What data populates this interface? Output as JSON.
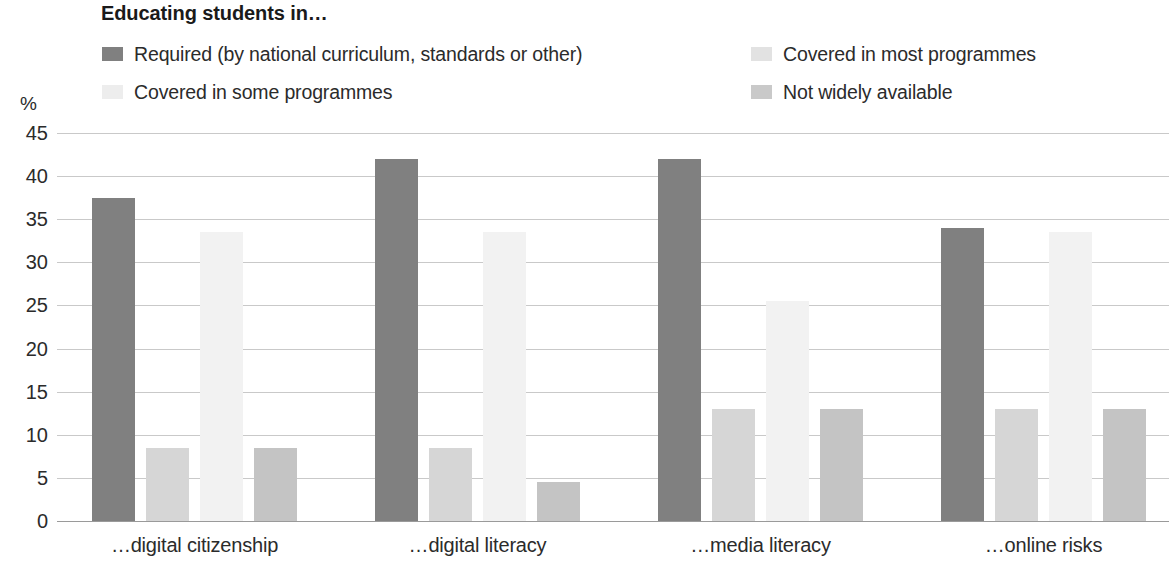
{
  "chart_data": {
    "type": "bar",
    "title": "Educating students in…",
    "xlabel": "",
    "ylabel": "%",
    "ylim": [
      0,
      45
    ],
    "ytick_values": [
      45,
      40,
      35,
      30,
      25,
      20,
      15,
      10,
      5,
      0
    ],
    "ytick_labels": [
      "45",
      "40",
      "35",
      "30",
      "25",
      "20",
      "15",
      "10",
      "5",
      "0"
    ],
    "grid": true,
    "legend_position": "top",
    "categories": [
      "…digital citizenship",
      "…digital literacy",
      "…media literacy",
      "…online risks"
    ],
    "series": [
      {
        "name": "Required (by national curriculum, standards or other)",
        "color": "#808080",
        "values": [
          37.5,
          42,
          42,
          34
        ]
      },
      {
        "name": "Covered in some programmes",
        "color": "#d6d6d6",
        "values": [
          8.5,
          8.5,
          13,
          13
        ]
      },
      {
        "name": "Covered in most programmes",
        "color": "#f2f2f2",
        "values": [
          33.5,
          33.5,
          25.5,
          33.5
        ]
      },
      {
        "name": "Not widely available",
        "color": "#c4c4c4",
        "values": [
          8.5,
          4.5,
          13,
          13
        ]
      }
    ]
  },
  "legend": {
    "entries": [
      {
        "label": "Required (by national curriculum, standards or other)",
        "color": "#808080"
      },
      {
        "label": "Covered in some programmes",
        "color": "#ededed"
      },
      {
        "label": "Covered in most programmes",
        "color": "#e2e2e2"
      },
      {
        "label": "Not widely available",
        "color": "#c9c9c9"
      }
    ]
  },
  "colors": {
    "gridline": "#c9c9c9",
    "axis": "#9a9a9a",
    "text": "#2b2b2b",
    "title": "#1a1a1a"
  }
}
